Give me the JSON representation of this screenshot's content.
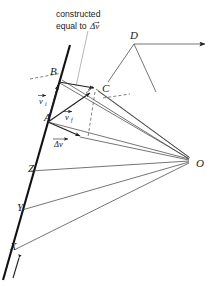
{
  "figure": {
    "title_note": {
      "line1": "constructed",
      "line2_prefix": "equal to ",
      "line2_symbol": "Δv"
    },
    "points": [
      {
        "id": "A",
        "label": "A",
        "x": 47,
        "y": 117
      },
      {
        "id": "B",
        "label": "B",
        "x": 53,
        "y": 71
      },
      {
        "id": "C",
        "label": "C",
        "x": 102,
        "y": 89
      },
      {
        "id": "D",
        "label": "D",
        "x": 133,
        "y": 36
      },
      {
        "id": "O",
        "label": "O",
        "x": 198,
        "y": 163
      },
      {
        "id": "X",
        "label": "X",
        "x": 14,
        "y": 246
      },
      {
        "id": "Y",
        "label": "Y",
        "x": 20,
        "y": 207
      },
      {
        "id": "Z",
        "label": "Z",
        "x": 31,
        "y": 168
      }
    ],
    "vectors": [
      {
        "id": "v-i-left",
        "label": "v",
        "subscript": "i",
        "x": 42,
        "y": 100
      },
      {
        "id": "v-f-mid",
        "label": "v",
        "subscript": "f",
        "x": 68,
        "y": 116
      },
      {
        "id": "delta-v-bottom",
        "label": "Δv",
        "x": 59,
        "y": 144
      }
    ],
    "colors": {
      "ink": "#1f1f1f",
      "light_ink": "#7a7a7a",
      "background": "#ffffff"
    }
  }
}
